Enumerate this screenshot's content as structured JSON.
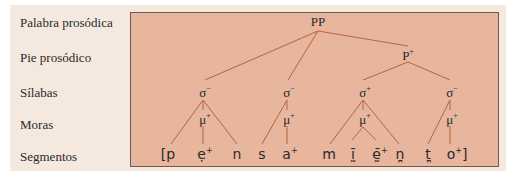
{
  "levels": [
    {
      "label": "Palabra prosódica"
    },
    {
      "label": "Pie prosódico"
    },
    {
      "label": "Sílabas"
    },
    {
      "label": "Moras"
    },
    {
      "label": "Segmentos"
    }
  ],
  "tree": {
    "root": {
      "label": "PP"
    },
    "foot": {
      "label": "P",
      "sup": "+"
    },
    "syllables": [
      {
        "label": "σ",
        "sup": "−"
      },
      {
        "label": "σ",
        "sup": "−"
      },
      {
        "label": "σ",
        "sup": "+"
      },
      {
        "label": "σ",
        "sup": "−"
      }
    ],
    "moras": [
      {
        "label": "μ",
        "sup": "+"
      },
      {
        "label": "μ",
        "sup": "+"
      },
      {
        "label": "μ",
        "sup": "+"
      },
      {
        "label": "μ",
        "sup": "+"
      }
    ],
    "segments": [
      {
        "label": "[p",
        "sup": ""
      },
      {
        "label": "ẹ",
        "sup": "+"
      },
      {
        "label": "n",
        "sup": ""
      },
      {
        "label": "s",
        "sup": ""
      },
      {
        "label": "a",
        "sup": "+"
      },
      {
        "label": "m",
        "sup": ""
      },
      {
        "label": "ḭ̄",
        "sup": ""
      },
      {
        "label": "ḛ̄",
        "sup": "+"
      },
      {
        "label": "n̪",
        "sup": ""
      },
      {
        "label": "t̪",
        "sup": ""
      },
      {
        "label": "o",
        "sup": "+]"
      }
    ]
  },
  "colors": {
    "panel_bg": "#f4e8df",
    "box_bg": "#e7b69c",
    "branch": "#b8643a",
    "text": "#2a2a2a"
  }
}
